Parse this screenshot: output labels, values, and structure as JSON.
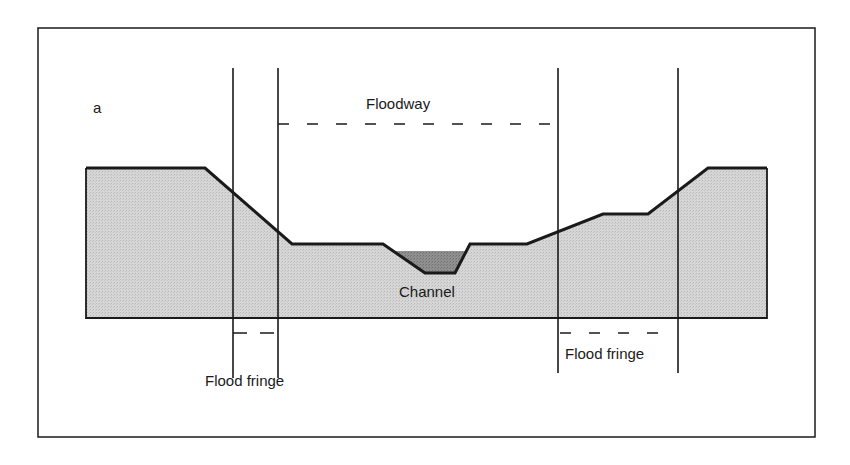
{
  "figure": {
    "panel_label": "a",
    "labels": {
      "floodway": "Floodway",
      "channel": "Channel",
      "flood_fringe_left": "Flood fringe",
      "flood_fringe_right": "Flood fringe"
    },
    "colors": {
      "terrain_fill": "#cfcfcf",
      "channel_water_fill": "#8a8a8a",
      "line": "#1a1a1a",
      "background": "#ffffff"
    }
  }
}
